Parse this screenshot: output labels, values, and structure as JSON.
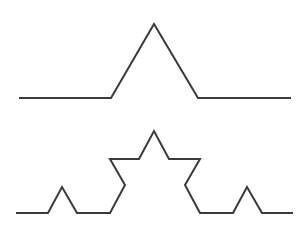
{
  "figure": {
    "type": "koch-curve-iterations",
    "stroke_color": "#3a3a3a",
    "background": "#ffffff",
    "curves": [
      {
        "name": "koch-iteration-1",
        "points": [
          [
            19,
            98
          ],
          [
            111,
            98
          ],
          [
            154,
            24
          ],
          [
            198,
            98
          ],
          [
            291,
            98
          ]
        ]
      },
      {
        "name": "koch-iteration-2",
        "points": [
          [
            16,
            213
          ],
          [
            48,
            213
          ],
          [
            62,
            187
          ],
          [
            77,
            213
          ],
          [
            110,
            213
          ],
          [
            125,
            185
          ],
          [
            110,
            159
          ],
          [
            139,
            159
          ],
          [
            154,
            131
          ],
          [
            169,
            159
          ],
          [
            200,
            159
          ],
          [
            185,
            185
          ],
          [
            200,
            213
          ],
          [
            233,
            213
          ],
          [
            247,
            187
          ],
          [
            262,
            213
          ],
          [
            293,
            213
          ]
        ]
      }
    ],
    "caption": ""
  }
}
